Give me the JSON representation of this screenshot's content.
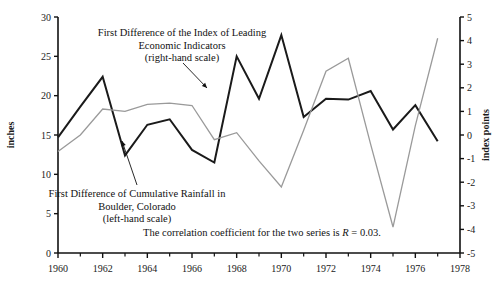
{
  "chart_data": {
    "type": "line",
    "title": "",
    "xlabel": "",
    "ylabel": "inches",
    "y2label": "index points",
    "xlim": [
      1959,
      1978
    ],
    "ylim": [
      0,
      30
    ],
    "y2lim": [
      -5,
      5
    ],
    "xticks": [
      1960,
      1962,
      1964,
      1966,
      1968,
      1970,
      1972,
      1974,
      1976,
      1978
    ],
    "xticks_minor": [
      1961,
      1963,
      1965,
      1967,
      1969,
      1971,
      1973,
      1975,
      1977
    ],
    "yticks": [
      0,
      5,
      10,
      15,
      20,
      25,
      30
    ],
    "y2ticks": [
      -5,
      -4,
      -3,
      -2,
      -1,
      0,
      1,
      2,
      3,
      4,
      5
    ],
    "grid": false,
    "legend": "annotations",
    "x": [
      1960,
      1961,
      1962,
      1963,
      1964,
      1965,
      1966,
      1967,
      1968,
      1969,
      1970,
      1971,
      1972,
      1973,
      1974,
      1975,
      1976,
      1977
    ],
    "series": [
      {
        "name": "First Difference of Cumulative Rainfall in Boulder, Colorado",
        "axis": "left",
        "unit": "inches",
        "color": "#1a1a1a",
        "width": 2.0,
        "values": [
          14.7,
          18.6,
          22.4,
          12.4,
          16.3,
          17.0,
          13.1,
          11.5,
          25.0,
          19.6,
          27.7,
          17.3,
          19.6,
          19.5,
          20.6,
          15.7,
          18.8,
          14.2
        ]
      },
      {
        "name": "First Difference of the Index of Leading Economic Indicators",
        "axis": "right",
        "unit": "index points",
        "color": "#9a9a9a",
        "width": 1.3,
        "values": [
          -0.7,
          0.0,
          1.1,
          1.0,
          1.3,
          1.35,
          1.25,
          -0.2,
          0.1,
          -1.1,
          -2.2,
          0.2,
          2.7,
          3.25,
          -0.4,
          -3.9,
          0.4,
          4.1
        ]
      }
    ],
    "annotations": [
      {
        "name": "lei-annotation",
        "lines": [
          "First Difference of the Index of Leading",
          "Economic Indicators",
          "(right-hand scale)"
        ],
        "arrow_from": [
          183,
          63
        ],
        "arrow_to": [
          207,
          88
        ]
      },
      {
        "name": "rainfall-annotation",
        "lines": [
          "First Difference of Cumulative Rainfall in",
          "Boulder, Colorado",
          "(left-hand scale)"
        ],
        "arrow_from": [
          137,
          185
        ],
        "arrow_to": [
          122,
          141
        ]
      },
      {
        "name": "correlation-note",
        "prefix": "The correlation coefficient for the two series is ",
        "italic": "R",
        "suffix": " = 0.03."
      }
    ]
  },
  "axes": {
    "left_title": "inches",
    "right_title": "index points",
    "left_tick_labels": [
      "30",
      "25",
      "20",
      "15",
      "10",
      "5",
      "0"
    ],
    "right_tick_labels": [
      "5",
      "4",
      "3",
      "2",
      "1",
      "0",
      "-1",
      "-2",
      "-3",
      "-4",
      "-5"
    ],
    "x_tick_labels": [
      "1960",
      "1962",
      "1964",
      "1966",
      "1968",
      "1970",
      "1972",
      "1974",
      "1976",
      "1978"
    ]
  }
}
